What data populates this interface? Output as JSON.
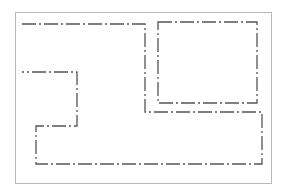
{
  "diagram": {
    "type": "floor-plan-outline",
    "frame": {
      "x": 15,
      "y": 12,
      "width": 256,
      "height": 171,
      "stroke": "#b8b8b8"
    },
    "line_color": "#555555",
    "line_style": "dash-dot",
    "shapes": [
      {
        "name": "main-outline",
        "points": "22,24 145,24 145,112 262,112 262,164 36,164 36,126 77,126 77,72 22,72"
      },
      {
        "name": "inner-rectangle",
        "x": 158,
        "y": 22,
        "width": 99,
        "height": 81
      }
    ]
  }
}
